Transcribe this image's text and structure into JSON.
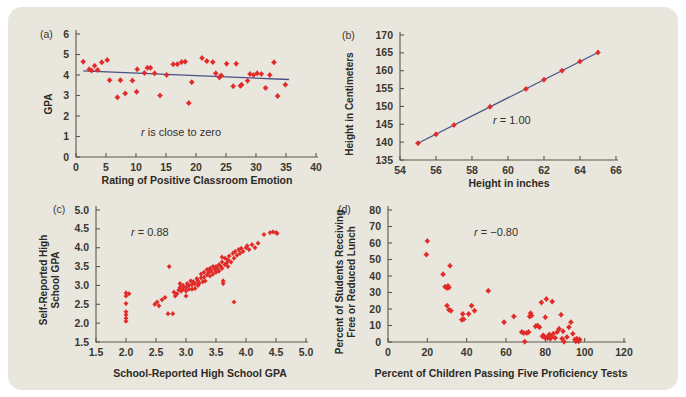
{
  "figure": {
    "background_color": "#e9e6dd",
    "marker_color": "#e22a28",
    "trendline_color": "#4b4f86",
    "axis_color": "#5b574c"
  },
  "panels": [
    {
      "letter": "(a)",
      "annotation": "r is close to zero",
      "annotation_italic_lead": "r",
      "xlabel": "Rating of Positive Classroom Emotion",
      "ylabel": "GPA",
      "xticks": [
        "0",
        "5",
        "10",
        "15",
        "20",
        "25",
        "30",
        "35",
        "40"
      ],
      "yticks": [
        "0",
        "1",
        "2",
        "3",
        "4",
        "5",
        "6"
      ]
    },
    {
      "letter": "(b)",
      "annotation": "r = 1.00",
      "annotation_italic_lead": "r",
      "xlabel": "Height in inches",
      "ylabel": "Height in Centimeters",
      "xticks": [
        "54",
        "56",
        "58",
        "60",
        "62",
        "64",
        "66"
      ],
      "yticks": [
        "135",
        "140",
        "145",
        "150",
        "155",
        "160",
        "165",
        "170"
      ]
    },
    {
      "letter": "(c)",
      "annotation": "r = 0.88",
      "annotation_italic_lead": "r",
      "xlabel": "School-Reported High School GPA",
      "ylabel_line1": "Self-Reported High",
      "ylabel_line2": "School GPA",
      "xticks": [
        "1.5",
        "2.0",
        "2.5",
        "3.0",
        "3.5",
        "4.0",
        "4.5",
        "5.0"
      ],
      "yticks": [
        "1.5",
        "2.0",
        "2.5",
        "3.0",
        "3.5",
        "4.0",
        "4.5",
        "5.0"
      ]
    },
    {
      "letter": "(d)",
      "annotation": "r = −0.80",
      "annotation_italic_lead": "r",
      "xlabel": "Percent of Children Passing Five Proficiency Tests",
      "ylabel_line1": "Percent of Students Receiving",
      "ylabel_line2": "Free or Reduced Lunch",
      "xticks": [
        "0",
        "20",
        "40",
        "60",
        "80",
        "100",
        "120"
      ],
      "yticks": [
        "0",
        "10",
        "20",
        "30",
        "40",
        "50",
        "60",
        "70",
        "80"
      ]
    }
  ],
  "chart_data": [
    {
      "type": "scatter",
      "panel": "a",
      "title": "",
      "xlabel": "Rating of Positive Classroom Emotion",
      "ylabel": "GPA",
      "xlim": [
        0,
        40
      ],
      "ylim": [
        0,
        6
      ],
      "xticks": [
        0,
        5,
        10,
        15,
        20,
        25,
        30,
        35,
        40
      ],
      "yticks": [
        0,
        1,
        2,
        3,
        4,
        5,
        6
      ],
      "grid": false,
      "legend": null,
      "annotation": "r is close to zero",
      "r": null,
      "trendline": {
        "x": [
          1.2,
          35.5
        ],
        "y": [
          4.2,
          3.78
        ]
      },
      "points": [
        [
          1.2,
          4.65
        ],
        [
          2.2,
          4.28
        ],
        [
          2.6,
          4.22
        ],
        [
          3.1,
          4.45
        ],
        [
          3.6,
          4.25
        ],
        [
          4.3,
          4.62
        ],
        [
          5.2,
          4.73
        ],
        [
          5.6,
          3.75
        ],
        [
          6.9,
          2.91
        ],
        [
          7.4,
          3.75
        ],
        [
          8.2,
          3.1
        ],
        [
          9.4,
          3.73
        ],
        [
          10.1,
          3.18
        ],
        [
          10.2,
          4.28
        ],
        [
          11.4,
          4.1
        ],
        [
          11.9,
          4.35
        ],
        [
          12.4,
          4.35
        ],
        [
          13.1,
          4.08
        ],
        [
          14.0,
          3.0
        ],
        [
          15.1,
          4.0
        ],
        [
          16.2,
          4.52
        ],
        [
          16.9,
          4.53
        ],
        [
          17.6,
          4.63
        ],
        [
          18.2,
          4.65
        ],
        [
          18.8,
          2.63
        ],
        [
          19.3,
          3.65
        ],
        [
          21.0,
          4.83
        ],
        [
          21.8,
          4.68
        ],
        [
          22.8,
          4.63
        ],
        [
          23.3,
          4.08
        ],
        [
          23.9,
          3.88
        ],
        [
          24.2,
          3.98
        ],
        [
          25.1,
          4.55
        ],
        [
          26.2,
          3.45
        ],
        [
          26.7,
          4.55
        ],
        [
          27.4,
          3.47
        ],
        [
          27.6,
          3.52
        ],
        [
          28.6,
          3.72
        ],
        [
          29.0,
          4.05
        ],
        [
          29.6,
          4.0
        ],
        [
          30.2,
          4.08
        ],
        [
          30.9,
          4.05
        ],
        [
          31.6,
          3.37
        ],
        [
          32.3,
          4.0
        ],
        [
          33.0,
          4.62
        ],
        [
          33.6,
          2.97
        ],
        [
          34.9,
          3.53
        ]
      ]
    },
    {
      "type": "scatter",
      "panel": "b",
      "title": "",
      "xlabel": "Height in inches",
      "ylabel": "Height in Centimeters",
      "xlim": [
        54,
        66
      ],
      "ylim": [
        135,
        170
      ],
      "xticks": [
        54,
        56,
        58,
        60,
        62,
        64,
        66
      ],
      "yticks": [
        135,
        140,
        145,
        150,
        155,
        160,
        165,
        170
      ],
      "grid": false,
      "legend": null,
      "annotation": "r = 1.00",
      "r": 1.0,
      "trendline": {
        "x": [
          55,
          65
        ],
        "y": [
          139.7,
          165.1
        ]
      },
      "points": [
        [
          55,
          139.7
        ],
        [
          56,
          142.2
        ],
        [
          57,
          144.8
        ],
        [
          59,
          149.9
        ],
        [
          61,
          154.9
        ],
        [
          62,
          157.5
        ],
        [
          63,
          160.0
        ],
        [
          64,
          162.6
        ],
        [
          65,
          165.1
        ]
      ]
    },
    {
      "type": "scatter",
      "panel": "c",
      "title": "",
      "xlabel": "School-Reported High School GPA",
      "ylabel": "Self-Reported High School GPA",
      "xlim": [
        1.5,
        5.0
      ],
      "ylim": [
        1.5,
        5.0
      ],
      "xticks": [
        1.5,
        2.0,
        2.5,
        3.0,
        3.5,
        4.0,
        4.5,
        5.0
      ],
      "yticks": [
        1.5,
        2.0,
        2.5,
        3.0,
        3.5,
        4.0,
        4.5,
        5.0
      ],
      "grid": false,
      "legend": null,
      "annotation": "r = 0.88",
      "r": 0.88,
      "points": [
        [
          2.0,
          2.05
        ],
        [
          2.0,
          2.13
        ],
        [
          2.0,
          2.22
        ],
        [
          2.0,
          2.3
        ],
        [
          2.0,
          2.52
        ],
        [
          2.0,
          2.72
        ],
        [
          2.0,
          2.8
        ],
        [
          2.05,
          2.78
        ],
        [
          2.48,
          2.5
        ],
        [
          2.52,
          2.56
        ],
        [
          2.55,
          2.46
        ],
        [
          2.6,
          2.62
        ],
        [
          2.65,
          2.68
        ],
        [
          2.7,
          2.25
        ],
        [
          2.72,
          3.5
        ],
        [
          2.78,
          2.25
        ],
        [
          2.8,
          2.82
        ],
        [
          2.82,
          2.72
        ],
        [
          2.85,
          2.78
        ],
        [
          2.88,
          2.88
        ],
        [
          2.9,
          2.95
        ],
        [
          2.9,
          3.05
        ],
        [
          2.92,
          2.85
        ],
        [
          2.95,
          2.9
        ],
        [
          2.95,
          3.0
        ],
        [
          3.0,
          2.72
        ],
        [
          3.0,
          2.85
        ],
        [
          3.0,
          2.95
        ],
        [
          3.02,
          3.05
        ],
        [
          3.05,
          2.9
        ],
        [
          3.05,
          3.0
        ],
        [
          3.08,
          3.12
        ],
        [
          3.1,
          2.9
        ],
        [
          3.1,
          3.02
        ],
        [
          3.12,
          3.1
        ],
        [
          3.15,
          2.92
        ],
        [
          3.15,
          3.05
        ],
        [
          3.18,
          3.18
        ],
        [
          3.2,
          3.0
        ],
        [
          3.2,
          3.12
        ],
        [
          3.22,
          3.05
        ],
        [
          3.25,
          3.2
        ],
        [
          3.25,
          3.3
        ],
        [
          3.28,
          3.1
        ],
        [
          3.3,
          3.22
        ],
        [
          3.3,
          3.35
        ],
        [
          3.32,
          3.12
        ],
        [
          3.35,
          3.28
        ],
        [
          3.35,
          3.42
        ],
        [
          3.38,
          3.35
        ],
        [
          3.4,
          3.25
        ],
        [
          3.4,
          3.45
        ],
        [
          3.42,
          3.38
        ],
        [
          3.45,
          3.3
        ],
        [
          3.45,
          3.5
        ],
        [
          3.48,
          3.42
        ],
        [
          3.5,
          3.35
        ],
        [
          3.5,
          3.5
        ],
        [
          3.52,
          3.45
        ],
        [
          3.55,
          3.38
        ],
        [
          3.55,
          3.55
        ],
        [
          3.58,
          3.5
        ],
        [
          3.6,
          3.45
        ],
        [
          3.6,
          3.62
        ],
        [
          3.6,
          3.75
        ],
        [
          3.62,
          3.05
        ],
        [
          3.62,
          3.12
        ],
        [
          3.65,
          3.55
        ],
        [
          3.65,
          3.72
        ],
        [
          3.68,
          3.6
        ],
        [
          3.7,
          3.5
        ],
        [
          3.7,
          3.68
        ],
        [
          3.72,
          3.78
        ],
        [
          3.75,
          3.62
        ],
        [
          3.78,
          3.85
        ],
        [
          3.8,
          2.56
        ],
        [
          3.8,
          3.72
        ],
        [
          3.82,
          3.9
        ],
        [
          3.85,
          3.8
        ],
        [
          3.88,
          3.95
        ],
        [
          3.9,
          3.85
        ],
        [
          3.92,
          3.98
        ],
        [
          3.95,
          3.9
        ],
        [
          4.0,
          4.0
        ],
        [
          4.02,
          4.05
        ],
        [
          4.05,
          3.95
        ],
        [
          4.1,
          4.08
        ],
        [
          4.15,
          4.0
        ],
        [
          4.2,
          4.12
        ],
        [
          4.3,
          4.35
        ],
        [
          4.4,
          4.4
        ],
        [
          4.45,
          4.42
        ],
        [
          4.5,
          4.4
        ],
        [
          4.52,
          4.38
        ]
      ]
    },
    {
      "type": "scatter",
      "panel": "d",
      "title": "",
      "xlabel": "Percent of Children Passing Five Proficiency Tests",
      "ylabel": "Percent of Students Receiving Free or Reduced Lunch",
      "xlim": [
        0,
        120
      ],
      "ylim": [
        0,
        80
      ],
      "xticks": [
        0,
        20,
        40,
        60,
        80,
        100,
        120
      ],
      "yticks": [
        0,
        10,
        20,
        30,
        40,
        50,
        60,
        70,
        80
      ],
      "grid": false,
      "legend": null,
      "annotation": "r = −0.80",
      "r": -0.8,
      "points": [
        [
          19.5,
          53.0
        ],
        [
          20.0,
          61.2
        ],
        [
          28.0,
          41.0
        ],
        [
          29.0,
          33.5
        ],
        [
          30.0,
          32.8
        ],
        [
          30.5,
          34.0
        ],
        [
          31.0,
          33.0
        ],
        [
          31.5,
          46.2
        ],
        [
          30.0,
          22.0
        ],
        [
          31.0,
          19.5
        ],
        [
          32.0,
          19.0
        ],
        [
          37.5,
          13.5
        ],
        [
          38.5,
          13.8
        ],
        [
          38.0,
          17.0
        ],
        [
          41.0,
          17.0
        ],
        [
          42.5,
          22.0
        ],
        [
          44.0,
          19.0
        ],
        [
          51.0,
          31.0
        ],
        [
          59.0,
          12.0
        ],
        [
          64.0,
          15.5
        ],
        [
          68.0,
          6.0
        ],
        [
          69.0,
          5.5
        ],
        [
          69.5,
          0.2
        ],
        [
          70.5,
          5.5
        ],
        [
          71.5,
          6.0
        ],
        [
          72.0,
          15.5
        ],
        [
          72.5,
          17.5
        ],
        [
          73.0,
          16.0
        ],
        [
          75.0,
          9.5
        ],
        [
          76.0,
          10.0
        ],
        [
          77.0,
          9.0
        ],
        [
          78.0,
          24.0
        ],
        [
          78.5,
          3.5
        ],
        [
          79.0,
          4.0
        ],
        [
          79.5,
          3.0
        ],
        [
          80.0,
          15.0
        ],
        [
          80.5,
          26.0
        ],
        [
          81.0,
          2.5
        ],
        [
          81.5,
          3.5
        ],
        [
          82.0,
          4.5
        ],
        [
          82.5,
          2.0
        ],
        [
          83.0,
          3.0
        ],
        [
          83.5,
          24.5
        ],
        [
          84.0,
          5.0
        ],
        [
          85.0,
          2.5
        ],
        [
          86.0,
          6.0
        ],
        [
          87.0,
          8.0
        ],
        [
          88.0,
          16.5
        ],
        [
          88.5,
          2.0
        ],
        [
          89.0,
          6.5
        ],
        [
          89.5,
          0.2
        ],
        [
          91.0,
          3.0
        ],
        [
          92.0,
          9.0
        ],
        [
          93.0,
          12.0
        ],
        [
          94.0,
          5.0
        ],
        [
          95.0,
          1.5
        ],
        [
          95.5,
          0.5
        ],
        [
          96.0,
          2.0
        ],
        [
          96.5,
          1.0
        ],
        [
          97.0,
          0.5
        ],
        [
          97.5,
          1.5
        ]
      ]
    }
  ]
}
